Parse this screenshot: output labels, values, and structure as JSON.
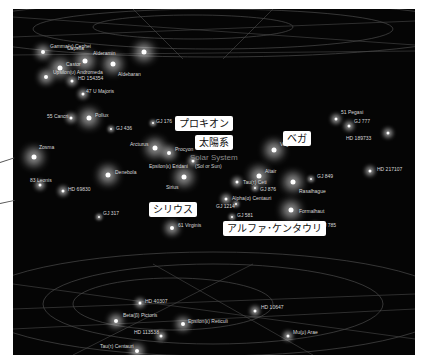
{
  "solar_system": {
    "label": "Solar System",
    "sublabel": "(Sol or Sun)"
  },
  "callouts": [
    {
      "id": "procyon",
      "text": "プロキオン"
    },
    {
      "id": "sun",
      "text": "太陽系"
    },
    {
      "id": "vega",
      "text": "ベガ"
    },
    {
      "id": "sirius",
      "text": "シリウス"
    },
    {
      "id": "alpha-cen",
      "text": "アルファ･ケンタウリ"
    }
  ],
  "stars": [
    {
      "name": "Capella",
      "size": "large"
    },
    {
      "name": "Castor",
      "size": "large"
    },
    {
      "name": "Aldebaran",
      "size": "large"
    },
    {
      "name": "47 U Majoris",
      "size": "small"
    },
    {
      "name": "55 Cancri",
      "size": "small"
    },
    {
      "name": "Pollux",
      "size": "large"
    },
    {
      "name": "GJ 436",
      "size": "tiny"
    },
    {
      "name": "GJ 176",
      "size": "tiny"
    },
    {
      "name": "Zosma",
      "size": "large"
    },
    {
      "name": "Arcturus",
      "size": "large"
    },
    {
      "name": "Procyon",
      "size": "medium"
    },
    {
      "name": "Epsilon(ε) Eridani",
      "size": "small"
    },
    {
      "name": "Denebola",
      "size": "large"
    },
    {
      "name": "83 Leonis",
      "size": "small"
    },
    {
      "name": "HD 69830",
      "size": "small"
    },
    {
      "name": "Sirius",
      "size": "large"
    },
    {
      "name": "GJ 317",
      "size": "tiny"
    },
    {
      "name": "61 Virginis",
      "size": "medium"
    },
    {
      "name": "Gamma(γ) Cephei",
      "size": "medium"
    },
    {
      "name": "Alderamin",
      "size": "large"
    },
    {
      "name": "Upsilon(υ) Andromeda",
      "size": "medium"
    },
    {
      "name": "HD 154354",
      "size": "small"
    },
    {
      "name": "51 Pegasi",
      "size": "small"
    },
    {
      "name": "GJ 777",
      "size": "small"
    },
    {
      "name": "HD 189733",
      "size": "small"
    },
    {
      "name": "Vega",
      "size": "large"
    },
    {
      "name": "Altair",
      "size": "large"
    },
    {
      "name": "Tau(τ) Ceti",
      "size": "small"
    },
    {
      "name": "GJ 876",
      "size": "tiny"
    },
    {
      "name": "Rasalhague",
      "size": "large"
    },
    {
      "name": "GJ 849",
      "size": "tiny"
    },
    {
      "name": "HD 217107",
      "size": "small"
    },
    {
      "name": "Alpha(α) Centauri",
      "size": "small"
    },
    {
      "name": "GJ 581",
      "size": "tiny"
    },
    {
      "name": "GJ 1214",
      "size": "tiny"
    },
    {
      "name": "Formalhaut",
      "size": "large"
    },
    {
      "name": "GJ 785",
      "size": "small"
    },
    {
      "name": "HD 40307",
      "size": "small"
    },
    {
      "name": "Beta(β) Pictoris",
      "size": "medium"
    },
    {
      "name": "Epsilon(ε) Reticuli",
      "size": "medium"
    },
    {
      "name": "HD 10647",
      "size": "small"
    },
    {
      "name": "HD 113538",
      "size": "small"
    },
    {
      "name": "Tau(τ) Centauri",
      "size": "medium"
    },
    {
      "name": "Mu(μ) Arae",
      "size": "small"
    }
  ]
}
